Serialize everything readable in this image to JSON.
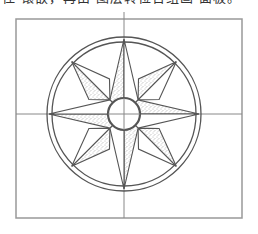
{
  "caption_fragment": "住  镶嵌，再由  图层转位告组画  面板。",
  "diagram": {
    "type": "compass-rose",
    "frame": {
      "x": 16,
      "y": 19,
      "width": 226,
      "height": 199
    },
    "center": {
      "x": 124,
      "y": 114
    },
    "rings": {
      "outer_radius": 77,
      "inner_radius": 72
    },
    "center_circle_radius": 16,
    "main_point_radius": 75,
    "diagonal_point_radius": 74,
    "main_point_base_radius": 20,
    "diagonal_point_base_radius": 38,
    "points": [
      "N",
      "NE",
      "E",
      "SE",
      "S",
      "SW",
      "W",
      "NW"
    ],
    "shaded_side": "counterclockwise half of each point",
    "colors": {
      "line": "#555555",
      "frame": "#999999",
      "crosshair": "#888888",
      "stipple": "#777777",
      "background": "#ffffff"
    }
  }
}
